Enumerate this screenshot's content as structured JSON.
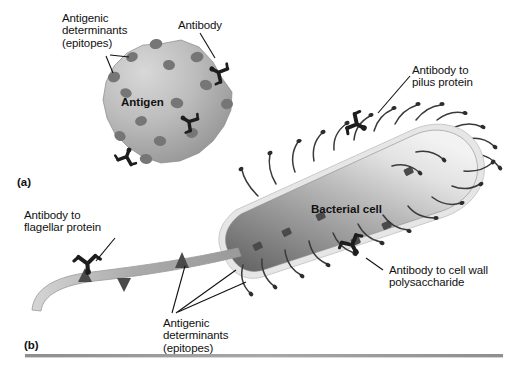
{
  "figure": {
    "background_color": "#ffffff",
    "width": 513,
    "height": 372,
    "divider_color": "#9a9a9a"
  },
  "panels": [
    {
      "id": "a",
      "tag": "(a)"
    },
    {
      "id": "b",
      "tag": "(b)"
    }
  ],
  "labels": {
    "antigenic_determinants_top": "Antigenic\ndeterminants\n(epitopes)",
    "antibody_top": "Antibody",
    "antigen_body": "Antigen",
    "antibody_pilus": "Antibody to\npilus protein",
    "bacterial_cell": "Bacterial cell",
    "antibody_cell_wall": "Antibody to cell wall\npolysaccharide",
    "antibody_flagellar": "Antibody to\nflagellar protein",
    "antigenic_determinants_bottom": "Antigenic\ndeterminants\n(epitopes)"
  },
  "colors": {
    "antigen_fill_light": "#cfcfcf",
    "antigen_fill_dark": "#9c9c9c",
    "epitope": "#6d6d6d",
    "antibody": "#1d1d1d",
    "cell_fill_light": "#ededed",
    "cell_fill_mid": "#b4b4b4",
    "cell_fill_dark": "#6f6f6f",
    "cell_rim": "#d8d8d8",
    "pilus": "#3a3a3a",
    "flagellum": "#b0b0b0",
    "leader_line": "#111111",
    "text": "#111111"
  },
  "elements": {
    "antigen_epitope_count": 14,
    "antigen_antibody_count": 3,
    "cell_pilus_count": 26,
    "cell_wall_epitope_count": 6,
    "flagellum_epitope_count": 3
  }
}
